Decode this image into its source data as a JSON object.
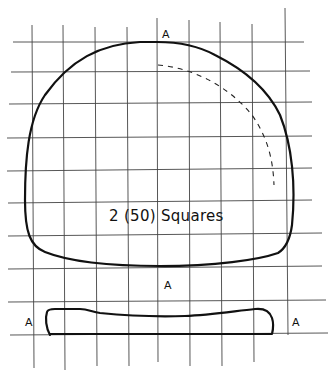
{
  "diagram": {
    "caption": "2 (50) Squares",
    "markers": {
      "top": "A",
      "bottom": "A",
      "bar_left": "A",
      "bar_right": "A"
    },
    "grid": {
      "vertical_lines_x": [
        32,
        63,
        95,
        127,
        157,
        189,
        220,
        252,
        286
      ],
      "horizontal_lines_y": [
        42,
        72,
        103,
        137,
        170,
        202,
        236,
        269,
        301,
        334
      ]
    },
    "shapes": [
      {
        "name": "main-pattern-piece",
        "style": "solid",
        "description": "large rounded dome shape"
      },
      {
        "name": "inner-guide-arc",
        "style": "dashed",
        "description": "quarter arc in upper right"
      },
      {
        "name": "strip-pattern-piece",
        "style": "solid",
        "description": "long narrow strip below"
      }
    ]
  }
}
